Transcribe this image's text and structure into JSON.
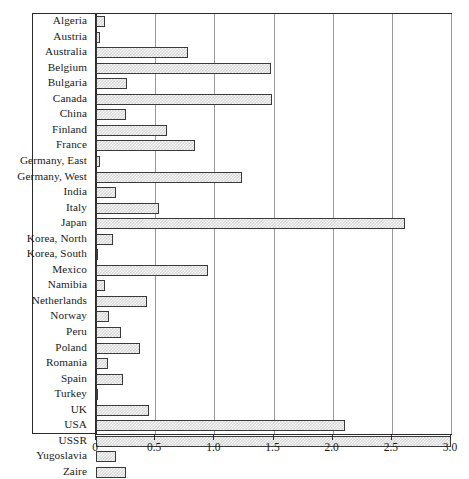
{
  "chart_data": {
    "type": "bar",
    "orientation": "horizontal",
    "title": "",
    "xlabel": "",
    "ylabel": "",
    "xlim": [
      0,
      3.0
    ],
    "xticks": [
      "0",
      "0.5",
      "1.0",
      "1.5",
      "2.0",
      "2.5",
      "3.0"
    ],
    "xtick_values": [
      0,
      0.5,
      1.0,
      1.5,
      2.0,
      2.5,
      3.0
    ],
    "grid": true,
    "legend": "none",
    "categories": [
      "Algeria",
      "Austria",
      "Australia",
      "Belgium",
      "Bulgaria",
      "Canada",
      "China",
      "Finland",
      "France",
      "Germany, East",
      "Germany, West",
      "India",
      "Italy",
      "Japan",
      "Korea, North",
      "Korea, South",
      "Mexico",
      "Namibia",
      "Netherlands",
      "Norway",
      "Peru",
      "Poland",
      "Romania",
      "Spain",
      "Turkey",
      "UK",
      "USA",
      "USSR",
      "Yugoslavia",
      "Zaire"
    ],
    "values": [
      0.08,
      0.03,
      0.78,
      1.48,
      0.26,
      1.49,
      0.25,
      0.6,
      0.84,
      0.03,
      1.23,
      0.17,
      0.53,
      2.61,
      0.14,
      0.02,
      0.95,
      0.08,
      0.43,
      0.11,
      0.21,
      0.37,
      0.1,
      0.23,
      0.01,
      0.45,
      2.1,
      3.0,
      0.17,
      0.25
    ]
  },
  "colors": {
    "bar_fill": "#d8d8d8",
    "bar_border": "#3a3a3a",
    "grid": "#9a9a9a",
    "frame": "#2b2b2b",
    "text": "#1a1a1a",
    "background": "#ffffff"
  }
}
